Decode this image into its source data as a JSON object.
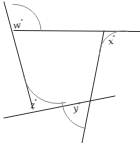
{
  "figure": {
    "background_color": "#ffffff",
    "line_color": "#3a3a3a",
    "arc_color": "#8a8a8a",
    "degree_symbol": "°",
    "angles": [
      {
        "id": "w",
        "label": "w",
        "position": "top-left",
        "vertex": "top-left corner of quadrilateral"
      },
      {
        "id": "x",
        "label": "x",
        "position": "top-right",
        "vertex": "top-right corner of quadrilateral"
      },
      {
        "id": "z",
        "label": "z",
        "position": "bottom-left",
        "vertex": "bottom-left corner of quadrilateral"
      },
      {
        "id": "y",
        "label": "y",
        "position": "bottom-right",
        "vertex": "bottom-right corner of quadrilateral"
      }
    ]
  }
}
